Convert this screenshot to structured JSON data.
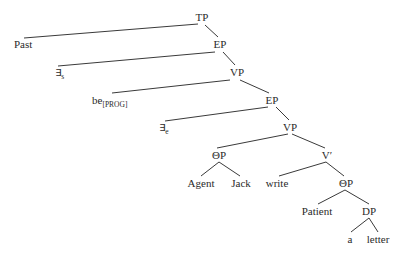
{
  "tree": {
    "nodes": {
      "tp": "TP",
      "past": "Past",
      "ep1": "EP",
      "exists_s": "∃",
      "exists_s_sub": "s",
      "vp1": "VP",
      "be": "be",
      "be_sub": "[PROG]",
      "ep2": "EP",
      "exists_e": "∃",
      "exists_e_sub": "e",
      "vp2": "VP",
      "theta1": "ΘP",
      "vbar": "V′",
      "agent": "Agent",
      "jack": "Jack",
      "write": "write",
      "theta2": "ΘP",
      "patient": "Patient",
      "dp": "DP",
      "a": "a",
      "letter": "letter"
    },
    "edges": [
      [
        "TP",
        "Past"
      ],
      [
        "TP",
        "EP"
      ],
      [
        "EP",
        "∃s"
      ],
      [
        "EP",
        "VP"
      ],
      [
        "VP",
        "be[PROG]"
      ],
      [
        "VP",
        "EP"
      ],
      [
        "EP",
        "∃e"
      ],
      [
        "EP",
        "VP"
      ],
      [
        "VP",
        "ΘP"
      ],
      [
        "VP",
        "V′"
      ],
      [
        "ΘP",
        "Agent"
      ],
      [
        "ΘP",
        "Jack"
      ],
      [
        "V′",
        "write"
      ],
      [
        "V′",
        "ΘP"
      ],
      [
        "ΘP",
        "Patient"
      ],
      [
        "ΘP",
        "DP"
      ],
      [
        "DP",
        "a"
      ],
      [
        "DP",
        "letter"
      ]
    ]
  }
}
